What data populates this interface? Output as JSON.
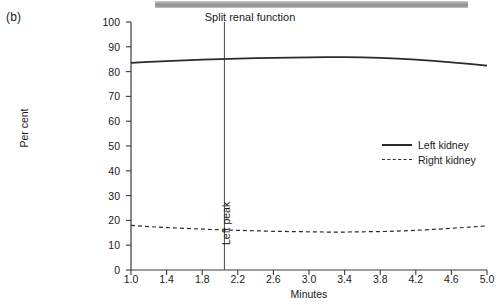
{
  "figure": {
    "panel_label": "(b)",
    "title": "Split renal function"
  },
  "axes": {
    "ylabel": "Per cent",
    "xlabel": "Minutes",
    "yticks": [
      "0",
      "10",
      "20",
      "30",
      "40",
      "50",
      "60",
      "70",
      "80",
      "90",
      "100"
    ],
    "xticks": [
      "1.0",
      "1.4",
      "1.8",
      "2.2",
      "2.6",
      "3.0",
      "3.4",
      "3.8",
      "4.2",
      "4.6",
      "5.0"
    ]
  },
  "legend": {
    "items": [
      {
        "label": "Left kidney",
        "style": "solid"
      },
      {
        "label": "Right kidney",
        "style": "dashed"
      }
    ]
  },
  "annotations": {
    "left_peak": "Left peak"
  },
  "colors": {
    "axis": "#3a3a3a",
    "line": "#2b2b2b",
    "marker_line": "#5a5a5a",
    "scan_bar": "#9a9a9a",
    "background": "#ffffff"
  },
  "chart_data": {
    "type": "line",
    "title": "Split renal function",
    "xlabel": "Minutes",
    "ylabel": "Per cent",
    "xlim": [
      1.0,
      5.0
    ],
    "ylim": [
      0,
      100
    ],
    "grid": false,
    "legend_position": "right-middle",
    "x": [
      1.0,
      1.2,
      1.4,
      1.6,
      1.8,
      2.0,
      2.2,
      2.4,
      2.6,
      2.8,
      3.0,
      3.2,
      3.4,
      3.6,
      3.8,
      4.0,
      4.2,
      4.4,
      4.6,
      4.8,
      5.0
    ],
    "series": [
      {
        "name": "Left kidney",
        "style": "solid",
        "values": [
          83.5,
          83.9,
          84.2,
          84.5,
          84.8,
          85.0,
          85.2,
          85.4,
          85.5,
          85.6,
          85.7,
          85.8,
          85.8,
          85.7,
          85.5,
          85.2,
          84.8,
          84.3,
          83.7,
          83.1,
          82.4
        ]
      },
      {
        "name": "Right kidney",
        "style": "dashed",
        "values": [
          18.0,
          17.5,
          17.1,
          16.8,
          16.5,
          16.2,
          16.0,
          15.8,
          15.6,
          15.5,
          15.4,
          15.3,
          15.3,
          15.4,
          15.5,
          15.7,
          16.0,
          16.4,
          16.8,
          17.3,
          17.8
        ]
      }
    ],
    "annotations": [
      {
        "label": "Left peak",
        "type": "vline",
        "x": 2.05
      }
    ]
  }
}
